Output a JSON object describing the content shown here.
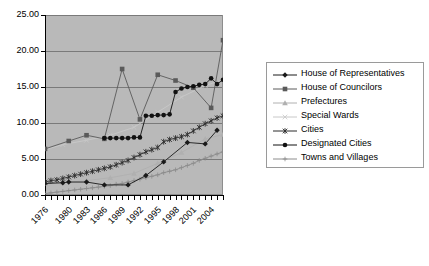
{
  "chart_data": {
    "type": "line",
    "title": "",
    "xlabel": "",
    "ylabel": "",
    "ylim": [
      0,
      25
    ],
    "ytick_step": 5,
    "ytick_labels": [
      "0.00",
      "5.00",
      "10.00",
      "15.00",
      "20.00",
      "25.00"
    ],
    "ytick_values": [
      0,
      5,
      10,
      15,
      20,
      25
    ],
    "grid": true,
    "legend_position": "right",
    "x": [
      1976,
      1977,
      1978,
      1979,
      1980,
      1981,
      1982,
      1983,
      1984,
      1985,
      1986,
      1987,
      1988,
      1989,
      1990,
      1991,
      1992,
      1993,
      1994,
      1995,
      1996,
      1997,
      1998,
      1999,
      2000,
      2001,
      2002,
      2003,
      2004,
      2005,
      2006
    ],
    "xtick_labels": [
      "1976",
      "1980",
      "1983",
      "1986",
      "1989",
      "1992",
      "1995",
      "1998",
      "2001",
      "2004"
    ],
    "xtick_label_years": [
      1976,
      1980,
      1983,
      1986,
      1989,
      1992,
      1995,
      1998,
      2001,
      2004
    ],
    "series": [
      {
        "name": "House of Representatives",
        "color": "#1a1a1a",
        "marker": "diamond",
        "points": [
          {
            "x": 1976,
            "y": 1.6
          },
          {
            "x": 1979,
            "y": 1.7
          },
          {
            "x": 1980,
            "y": 1.8
          },
          {
            "x": 1983,
            "y": 1.8
          },
          {
            "x": 1986,
            "y": 1.4
          },
          {
            "x": 1990,
            "y": 1.4
          },
          {
            "x": 1993,
            "y": 2.7
          },
          {
            "x": 1996,
            "y": 4.6
          },
          {
            "x": 2000,
            "y": 7.3
          },
          {
            "x": 2003,
            "y": 7.1
          },
          {
            "x": 2005,
            "y": 9.0
          }
        ]
      },
      {
        "name": "House of Councilors",
        "color": "#5a5a5a",
        "marker": "square",
        "points": [
          {
            "x": 1976,
            "y": 6.4
          },
          {
            "x": 1980,
            "y": 7.5
          },
          {
            "x": 1983,
            "y": 8.3
          },
          {
            "x": 1986,
            "y": 7.8
          },
          {
            "x": 1989,
            "y": 17.5
          },
          {
            "x": 1992,
            "y": 10.5
          },
          {
            "x": 1995,
            "y": 16.7
          },
          {
            "x": 1998,
            "y": 15.9
          },
          {
            "x": 2001,
            "y": 14.9
          },
          {
            "x": 2004,
            "y": 12.1
          },
          {
            "x": 2006,
            "y": 21.5
          }
        ]
      },
      {
        "name": "Prefectures",
        "color": "#b0b0b0",
        "marker": "triangle",
        "points": [
          {
            "x": 1976,
            "y": 1.6
          },
          {
            "x": 1979,
            "y": 1.7
          },
          {
            "x": 1983,
            "y": 2.0
          },
          {
            "x": 1987,
            "y": 2.4
          },
          {
            "x": 1991,
            "y": 3.0
          },
          {
            "x": 1995,
            "y": 4.4
          },
          {
            "x": 1999,
            "y": 5.9
          },
          {
            "x": 2003,
            "y": 7.8
          },
          {
            "x": 2006,
            "y": 8.4
          }
        ]
      },
      {
        "name": "Special Wards",
        "color": "#c8c8c8",
        "marker": "x-thin",
        "points": [
          {
            "x": 1976,
            "y": 6.3
          },
          {
            "x": 1979,
            "y": 7.0
          },
          {
            "x": 1983,
            "y": 7.6
          },
          {
            "x": 1987,
            "y": 8.3
          },
          {
            "x": 1991,
            "y": 9.4
          },
          {
            "x": 1995,
            "y": 11.5
          },
          {
            "x": 1999,
            "y": 13.6
          },
          {
            "x": 2003,
            "y": 15.2
          },
          {
            "x": 2006,
            "y": 16.0
          }
        ]
      },
      {
        "name": "Cities",
        "color": "#2b2b2b",
        "marker": "asterisk",
        "points": [
          {
            "x": 1976,
            "y": 1.8
          },
          {
            "x": 1977,
            "y": 2.0
          },
          {
            "x": 1978,
            "y": 2.1
          },
          {
            "x": 1979,
            "y": 2.3
          },
          {
            "x": 1980,
            "y": 2.5
          },
          {
            "x": 1981,
            "y": 2.7
          },
          {
            "x": 1982,
            "y": 2.9
          },
          {
            "x": 1983,
            "y": 3.1
          },
          {
            "x": 1984,
            "y": 3.3
          },
          {
            "x": 1985,
            "y": 3.5
          },
          {
            "x": 1986,
            "y": 3.7
          },
          {
            "x": 1987,
            "y": 3.9
          },
          {
            "x": 1988,
            "y": 4.2
          },
          {
            "x": 1989,
            "y": 4.5
          },
          {
            "x": 1990,
            "y": 4.8
          },
          {
            "x": 1991,
            "y": 5.2
          },
          {
            "x": 1992,
            "y": 5.6
          },
          {
            "x": 1993,
            "y": 6.0
          },
          {
            "x": 1994,
            "y": 6.3
          },
          {
            "x": 1995,
            "y": 6.6
          },
          {
            "x": 1996,
            "y": 7.4
          },
          {
            "x": 1997,
            "y": 7.7
          },
          {
            "x": 1998,
            "y": 7.9
          },
          {
            "x": 1999,
            "y": 8.1
          },
          {
            "x": 2000,
            "y": 8.4
          },
          {
            "x": 2001,
            "y": 8.9
          },
          {
            "x": 2002,
            "y": 9.4
          },
          {
            "x": 2003,
            "y": 9.9
          },
          {
            "x": 2004,
            "y": 10.3
          },
          {
            "x": 2005,
            "y": 10.7
          },
          {
            "x": 2006,
            "y": 11.0
          }
        ]
      },
      {
        "name": "Designated Cities",
        "color": "#111111",
        "marker": "circle",
        "points": [
          {
            "x": 1986,
            "y": 7.9
          },
          {
            "x": 1987,
            "y": 7.9
          },
          {
            "x": 1988,
            "y": 7.9
          },
          {
            "x": 1989,
            "y": 7.9
          },
          {
            "x": 1990,
            "y": 7.9
          },
          {
            "x": 1991,
            "y": 8.0
          },
          {
            "x": 1992,
            "y": 8.0
          },
          {
            "x": 1993,
            "y": 11.0
          },
          {
            "x": 1994,
            "y": 11.0
          },
          {
            "x": 1995,
            "y": 11.1
          },
          {
            "x": 1996,
            "y": 11.1
          },
          {
            "x": 1997,
            "y": 11.2
          },
          {
            "x": 1998,
            "y": 14.3
          },
          {
            "x": 1999,
            "y": 14.8
          },
          {
            "x": 2000,
            "y": 15.0
          },
          {
            "x": 2001,
            "y": 15.1
          },
          {
            "x": 2002,
            "y": 15.3
          },
          {
            "x": 2003,
            "y": 15.4
          },
          {
            "x": 2004,
            "y": 16.2
          },
          {
            "x": 2005,
            "y": 15.4
          },
          {
            "x": 2006,
            "y": 16.0
          }
        ]
      },
      {
        "name": "Towns and Villages",
        "color": "#8c8c8c",
        "marker": "plus",
        "points": [
          {
            "x": 1976,
            "y": 0.2
          },
          {
            "x": 1977,
            "y": 0.3
          },
          {
            "x": 1978,
            "y": 0.4
          },
          {
            "x": 1979,
            "y": 0.5
          },
          {
            "x": 1980,
            "y": 0.6
          },
          {
            "x": 1981,
            "y": 0.7
          },
          {
            "x": 1982,
            "y": 0.8
          },
          {
            "x": 1983,
            "y": 0.9
          },
          {
            "x": 1984,
            "y": 1.0
          },
          {
            "x": 1985,
            "y": 1.1
          },
          {
            "x": 1986,
            "y": 1.2
          },
          {
            "x": 1987,
            "y": 1.3
          },
          {
            "x": 1988,
            "y": 1.5
          },
          {
            "x": 1989,
            "y": 1.6
          },
          {
            "x": 1990,
            "y": 1.8
          },
          {
            "x": 1991,
            "y": 2.0
          },
          {
            "x": 1992,
            "y": 2.2
          },
          {
            "x": 1993,
            "y": 2.4
          },
          {
            "x": 1994,
            "y": 2.6
          },
          {
            "x": 1995,
            "y": 2.8
          },
          {
            "x": 1996,
            "y": 3.1
          },
          {
            "x": 1997,
            "y": 3.3
          },
          {
            "x": 1998,
            "y": 3.5
          },
          {
            "x": 1999,
            "y": 3.8
          },
          {
            "x": 2000,
            "y": 4.1
          },
          {
            "x": 2001,
            "y": 4.4
          },
          {
            "x": 2002,
            "y": 4.8
          },
          {
            "x": 2003,
            "y": 5.1
          },
          {
            "x": 2004,
            "y": 5.4
          },
          {
            "x": 2005,
            "y": 5.7
          },
          {
            "x": 2006,
            "y": 6.0
          }
        ]
      }
    ]
  },
  "colors": {
    "plot_background": "#b9b9b9",
    "gridline": "#7a7a7a",
    "axis": "#000000",
    "legend_background": "#ffffff",
    "legend_border": "#9a9a9a"
  }
}
